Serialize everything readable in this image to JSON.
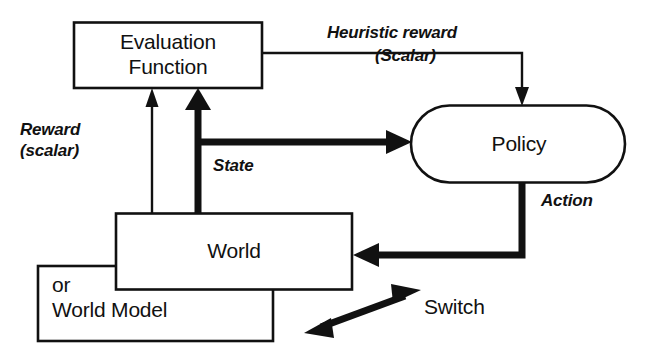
{
  "diagram": {
    "nodes": [
      {
        "id": "evaluation",
        "label": "Evaluation\nFunction",
        "shape": "rect"
      },
      {
        "id": "policy",
        "label": "Policy",
        "shape": "stadium"
      },
      {
        "id": "world",
        "label": "World",
        "shape": "rect"
      },
      {
        "id": "world_model",
        "label": "or\nWorld Model",
        "shape": "rect"
      }
    ],
    "edges": [
      {
        "id": "reward",
        "label": "Reward\n(scalar)",
        "from": "world",
        "to": "evaluation",
        "style": "thin",
        "italic": true
      },
      {
        "id": "state",
        "label": "State",
        "from": "world",
        "to": "evaluation_and_policy",
        "style": "thick",
        "italic": true
      },
      {
        "id": "heuristic_reward",
        "label": "Heuristic reward\n(Scalar)",
        "from": "evaluation",
        "to": "policy",
        "style": "thin",
        "italic": true
      },
      {
        "id": "action",
        "label": "Action",
        "from": "policy",
        "to": "world",
        "style": "thick",
        "italic": true
      },
      {
        "id": "switch",
        "label": "Switch",
        "from": "world",
        "to": "world_model",
        "style": "double-arrow",
        "italic": false
      }
    ],
    "labels": {
      "evaluation_line1": "Evaluation",
      "evaluation_line2": "Function",
      "policy": "Policy",
      "world": "World",
      "world_model_line1": "or",
      "world_model_line2": "World Model",
      "reward_line1": "Reward",
      "reward_line2": "(scalar)",
      "heuristic_line1": "Heuristic reward",
      "heuristic_line2": "(Scalar)",
      "state": "State",
      "action": "Action",
      "switch": "Switch"
    },
    "colors": {
      "stroke": "#111111",
      "background": "#ffffff",
      "text": "#111111"
    }
  }
}
